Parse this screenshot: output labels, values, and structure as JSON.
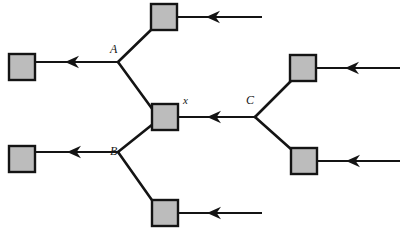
{
  "figure": {
    "type": "tree-diagram",
    "width": 404,
    "height": 233,
    "background_color": "#ffffff",
    "stroke_color": "#141414",
    "box_fill_color": "#bcbcbc",
    "box_border_color": "#141414",
    "box_size": 26,
    "labels": [
      {
        "id": "label-A",
        "text": "A",
        "x": 110,
        "y": 53,
        "style": "capital-italic"
      },
      {
        "id": "label-B",
        "text": "B",
        "x": 110,
        "y": 155,
        "style": "capital-italic"
      },
      {
        "id": "label-C",
        "text": "C",
        "x": 246,
        "y": 104,
        "style": "capital-italic"
      },
      {
        "id": "label-x",
        "text": "x",
        "x": 183,
        "y": 104,
        "style": "lowercase-italic"
      }
    ],
    "boxes": [
      {
        "id": "box-top-center",
        "x": 151,
        "y": 4
      },
      {
        "id": "box-left-upper",
        "x": 9,
        "y": 54
      },
      {
        "id": "box-right-upper",
        "x": 290,
        "y": 55
      },
      {
        "id": "box-center-x",
        "x": 152,
        "y": 104
      },
      {
        "id": "box-left-lower",
        "x": 9,
        "y": 146
      },
      {
        "id": "box-right-lower",
        "x": 291,
        "y": 148
      },
      {
        "id": "box-bottom-center",
        "x": 152,
        "y": 200
      }
    ],
    "junctions": [
      {
        "id": "junction-A",
        "x": 118,
        "y": 62
      },
      {
        "id": "junction-B",
        "x": 118,
        "y": 152
      },
      {
        "id": "junction-C",
        "x": 255,
        "y": 117
      }
    ],
    "arrow_edges": [
      {
        "id": "arrow-top-right-inflow",
        "from_x": 262,
        "from_y": 17,
        "to_x": 178,
        "to_y": 17,
        "head_x": 213,
        "head_y": 17
      },
      {
        "id": "arrow-to-left-upper-box",
        "from_x": 118,
        "from_y": 62,
        "to_x": 34,
        "to_y": 62,
        "head_x": 72,
        "head_y": 62
      },
      {
        "id": "arrow-right-upper-inflow",
        "from_x": 400,
        "from_y": 68,
        "to_x": 317,
        "to_y": 68,
        "head_x": 352,
        "head_y": 68
      },
      {
        "id": "arrow-center-x-inflow",
        "from_x": 255,
        "from_y": 117,
        "to_x": 179,
        "to_y": 117,
        "head_x": 214,
        "head_y": 117
      },
      {
        "id": "arrow-to-left-lower-box",
        "from_x": 118,
        "from_y": 152,
        "to_x": 36,
        "to_y": 152,
        "head_x": 74,
        "head_y": 152
      },
      {
        "id": "arrow-right-lower-inflow",
        "from_x": 400,
        "from_y": 161,
        "to_x": 318,
        "to_y": 161,
        "head_x": 353,
        "head_y": 161
      },
      {
        "id": "arrow-bottom-center-inflow",
        "from_x": 262,
        "from_y": 213,
        "to_x": 179,
        "to_y": 213,
        "head_x": 214,
        "head_y": 213
      }
    ],
    "plain_edges": [
      {
        "id": "edge-A-to-top-box",
        "from_x": 118,
        "from_y": 62,
        "to_x": 153,
        "to_y": 28
      },
      {
        "id": "edge-A-to-center-x",
        "from_x": 118,
        "from_y": 62,
        "to_x": 153,
        "to_y": 110
      },
      {
        "id": "edge-B-to-center-x",
        "from_x": 118,
        "from_y": 152,
        "to_x": 153,
        "to_y": 124
      },
      {
        "id": "edge-B-to-bottom-box",
        "from_x": 118,
        "from_y": 152,
        "to_x": 154,
        "to_y": 203
      },
      {
        "id": "edge-C-to-right-upper-box",
        "from_x": 255,
        "from_y": 117,
        "to_x": 291,
        "to_y": 81
      },
      {
        "id": "edge-C-to-right-lower-box",
        "from_x": 255,
        "from_y": 117,
        "to_x": 292,
        "to_y": 150
      }
    ]
  }
}
